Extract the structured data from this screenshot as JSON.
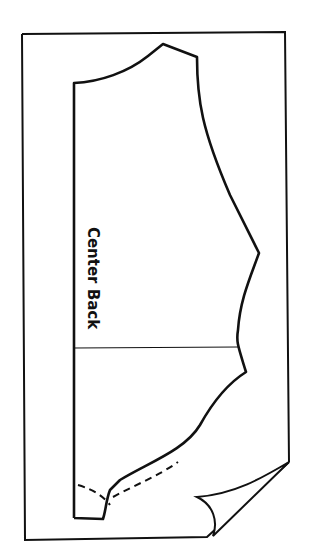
{
  "diagram": {
    "type": "sewing-pattern",
    "piece": "back bodice",
    "labels": {
      "center_back": "Center Back"
    },
    "elements": [
      "fabric-rectangle-with-folded-corner",
      "pattern-piece-outline",
      "waistline-marking",
      "dashed-cutting-line"
    ],
    "colors": {
      "line": "#111111",
      "background": "#ffffff"
    }
  }
}
